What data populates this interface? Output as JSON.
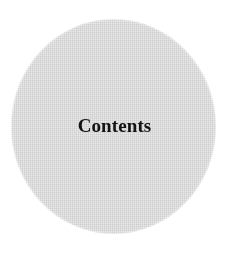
{
  "page": {
    "background_color": "#ffffff",
    "width": 240,
    "height": 258
  },
  "disc": {
    "name": "contents-disc",
    "shape": "circle",
    "fill_color": "#d4d4d4",
    "texture": "halftone-dither",
    "center_x": 113,
    "center_y": 126,
    "width": 205,
    "height": 215
  },
  "title": {
    "text": "Contents",
    "color": "#141414",
    "weight": "bold",
    "style": "serif"
  }
}
